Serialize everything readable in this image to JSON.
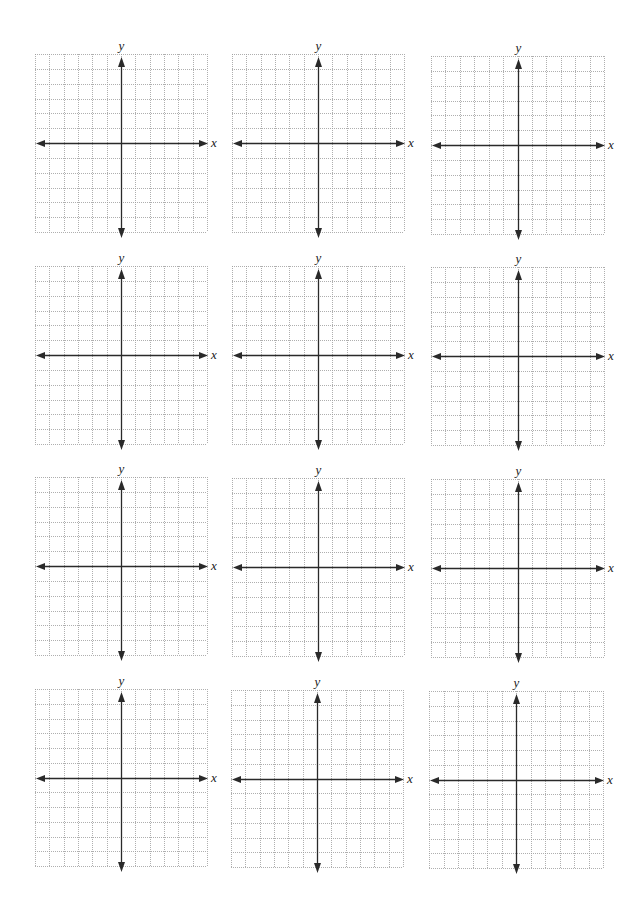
{
  "page": {
    "header_fragment": "",
    "background": "#ffffff"
  },
  "grid_style": {
    "columns": 12,
    "rows": 12,
    "gridline_color": "#9a9a9a",
    "axis_color": "#2a2a2a"
  },
  "axes": {
    "x_label": "x",
    "y_label": "y"
  },
  "planes": [
    {
      "id": 1,
      "row": 1,
      "col": 1,
      "left": 35,
      "top": 54,
      "width": 172,
      "height": 178
    },
    {
      "id": 2,
      "row": 1,
      "col": 2,
      "left": 232,
      "top": 54,
      "width": 172,
      "height": 178
    },
    {
      "id": 3,
      "row": 1,
      "col": 3,
      "left": 431,
      "top": 56,
      "width": 173,
      "height": 178
    },
    {
      "id": 4,
      "row": 2,
      "col": 1,
      "left": 35,
      "top": 266,
      "width": 172,
      "height": 178
    },
    {
      "id": 5,
      "row": 2,
      "col": 2,
      "left": 232,
      "top": 266,
      "width": 172,
      "height": 178
    },
    {
      "id": 6,
      "row": 2,
      "col": 3,
      "left": 431,
      "top": 267,
      "width": 173,
      "height": 178
    },
    {
      "id": 7,
      "row": 3,
      "col": 1,
      "left": 35,
      "top": 477,
      "width": 172,
      "height": 178
    },
    {
      "id": 8,
      "row": 3,
      "col": 2,
      "left": 232,
      "top": 478,
      "width": 172,
      "height": 178
    },
    {
      "id": 9,
      "row": 3,
      "col": 3,
      "left": 431,
      "top": 479,
      "width": 173,
      "height": 178
    },
    {
      "id": 10,
      "row": 4,
      "col": 1,
      "left": 35,
      "top": 689,
      "width": 172,
      "height": 177
    },
    {
      "id": 11,
      "row": 4,
      "col": 2,
      "left": 231,
      "top": 690,
      "width": 172,
      "height": 177
    },
    {
      "id": 12,
      "row": 4,
      "col": 3,
      "left": 429,
      "top": 691,
      "width": 174,
      "height": 177
    }
  ]
}
